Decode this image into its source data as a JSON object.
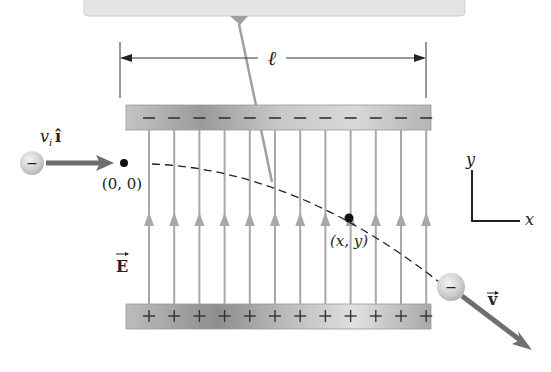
{
  "labels": {
    "length": "ℓ",
    "initial_velocity_v": "v",
    "initial_velocity_sub": "i",
    "initial_velocity_unit": "î",
    "origin": "(0, 0)",
    "point": "(x, y)",
    "field": "E",
    "final_velocity": "v",
    "axis_x": "x",
    "axis_y": "y",
    "negative_charge": "−",
    "top_plate_charge": "−",
    "bottom_plate_charge": "+"
  },
  "plates": {
    "top": {
      "charge": "negative",
      "sign_count": 12
    },
    "bottom": {
      "charge": "positive",
      "sign_count": 12
    }
  },
  "field_lines": {
    "count": 12,
    "direction": "upward"
  },
  "colors": {
    "plate": "#b8b8b8",
    "field_line": "#a8a8a8",
    "arrow": "#6e6e6e",
    "trajectory": "#222222",
    "callout_box": "#e4e4e4"
  }
}
